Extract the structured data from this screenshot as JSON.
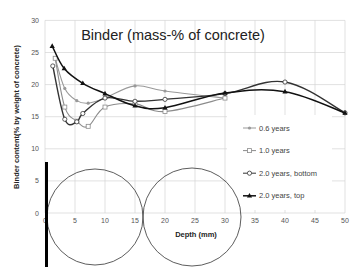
{
  "chart_data": {
    "type": "line",
    "title": "Binder (mass-% of concrete)",
    "xlabel": "Depth (mm)",
    "ylabel": "Binder content(% by weight of concrete)",
    "xlim": [
      0,
      50
    ],
    "ylim": [
      0,
      30
    ],
    "x_ticks": [
      0,
      5,
      10,
      15,
      20,
      25,
      30,
      35,
      40,
      45,
      50
    ],
    "y_ticks": [
      0,
      5,
      10,
      15,
      20,
      25,
      30
    ],
    "grid": true,
    "legend_position": "right",
    "series": [
      {
        "name": "0.6 years",
        "color": "#999999",
        "marker": "diamond",
        "x": [
          1.7,
          3.3,
          5.3,
          7.2,
          10,
          15,
          20,
          30
        ],
        "y": [
          24.1,
          19.4,
          17.5,
          17.1,
          17.9,
          19.8,
          19.0,
          17.9
        ]
      },
      {
        "name": "1.0 years",
        "color": "#8c8c8c",
        "marker": "square-open",
        "x": [
          1.7,
          3.3,
          5.3,
          7.2,
          10,
          15,
          20,
          30
        ],
        "y": [
          24.1,
          16.5,
          14.3,
          13.5,
          16.5,
          17.0,
          15.8,
          17.9
        ]
      },
      {
        "name": "2.0 years, bottom",
        "color": "#333333",
        "marker": "circle-open",
        "x": [
          1.3,
          3.3,
          5.3,
          6.3,
          10,
          15,
          20,
          30,
          40,
          50
        ],
        "y": [
          22.9,
          14.6,
          14.2,
          15.5,
          17.9,
          17.4,
          17.7,
          18.6,
          20.4,
          15.6
        ]
      },
      {
        "name": "2.0 years, top",
        "color": "#111111",
        "marker": "triangle",
        "x": [
          1.2,
          3.2,
          6.3,
          10,
          15,
          20,
          30,
          40,
          50
        ],
        "y": [
          26.0,
          22.5,
          20.2,
          18.6,
          16.7,
          16.4,
          18.7,
          18.9,
          15.6
        ]
      }
    ],
    "annotations": [
      {
        "type": "circle",
        "cx_px": 95,
        "cy_px": 217,
        "r_px": 48,
        "color": "#333333"
      },
      {
        "type": "circle",
        "cx_px": 192,
        "cy_px": 217,
        "r_px": 49,
        "color": "#333333"
      },
      {
        "type": "bar",
        "x_px": 46.5,
        "y1_px": 162,
        "y2_px": 267,
        "width_px": 3,
        "color": "#000000"
      }
    ]
  }
}
